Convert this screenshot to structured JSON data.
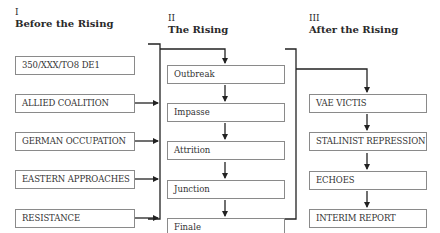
{
  "sections": [
    {
      "numeral": "I",
      "title": "Before the Rising",
      "items": [
        "350/XXX/TO8 DE1",
        "ALLIED COALITION",
        "GERMAN OCCUPATION",
        "EASTERN APPROACHES",
        "RESISTANCE"
      ]
    },
    {
      "numeral": "II",
      "title": "The Rising",
      "items": [
        "Outbreak",
        "Impasse",
        "Attrition",
        "Junction",
        "Finale"
      ]
    },
    {
      "numeral": "III",
      "title": "After the Rising",
      "items": [
        "VAE VICTIS",
        "STALINIST REPRESSION",
        "ECHOES",
        "INTERIM REPORT"
      ]
    }
  ],
  "colors": {
    "line": "#222222",
    "box_border": "#8a8a8a",
    "text": "#2a2a2a"
  }
}
